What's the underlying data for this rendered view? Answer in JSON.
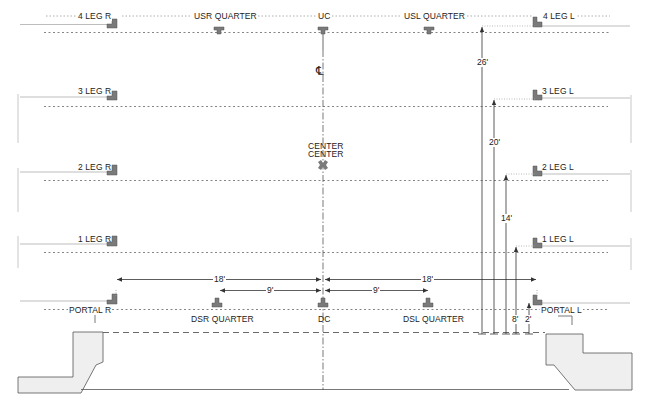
{
  "diagram": {
    "type": "stage-plot-section",
    "centerline_symbol": "℄",
    "center_label_line1": "CENTER",
    "center_label_line2": "CENTER",
    "top_labels": {
      "leg4_r": "4 LEG R",
      "usr_quarter": "USR QUARTER",
      "uc": "UC",
      "usl_quarter": "USL QUARTER",
      "leg4_l": "4 LEG L"
    },
    "legs": [
      {
        "right": "3 LEG R",
        "left": "3 LEG L"
      },
      {
        "right": "2 LEG R",
        "left": "2 LEG L"
      },
      {
        "right": "1 LEG R",
        "left": "1 LEG L"
      }
    ],
    "portal": {
      "right": "PORTAL  R",
      "left": "PORTAL  L"
    },
    "bottom_labels": {
      "dsr_quarter": "DSR QUARTER",
      "dc": "DC",
      "dsl_quarter": "DSL QUARTER"
    },
    "horizontal_dimensions": {
      "left_outer": "18'",
      "right_outer": "18'",
      "left_inner": "9'",
      "right_inner": "9'"
    },
    "vertical_dimensions": [
      "26'",
      "20'",
      "14'",
      "8'",
      "2'"
    ],
    "colors": {
      "line": "#333333",
      "light_line": "#bdbdbd",
      "marker": "#7a7a7a",
      "fill": "#efefef"
    }
  }
}
